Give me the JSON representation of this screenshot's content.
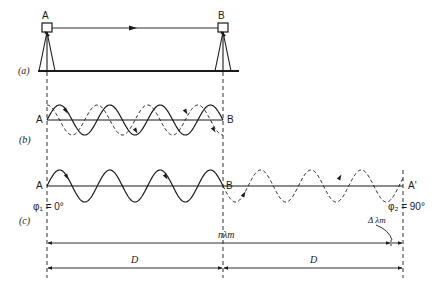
{
  "panels": {
    "a": {
      "label": "(a)",
      "station_a": "A",
      "station_b": "B"
    },
    "b": {
      "label": "(b)",
      "start": "A",
      "end": "B"
    },
    "c": {
      "label": "(c)",
      "start": "A",
      "mid": "B",
      "end": "A'",
      "phase1": "φ₁ = 0°",
      "phase2": "φ₂ = 90°"
    }
  },
  "dimensions": {
    "n_lambda": "nλm",
    "delta_lambda": "Δ λm",
    "d_left": "D",
    "d_right": "D"
  },
  "colors": {
    "ink": "#1a1a1a",
    "background": "#ffffff"
  }
}
